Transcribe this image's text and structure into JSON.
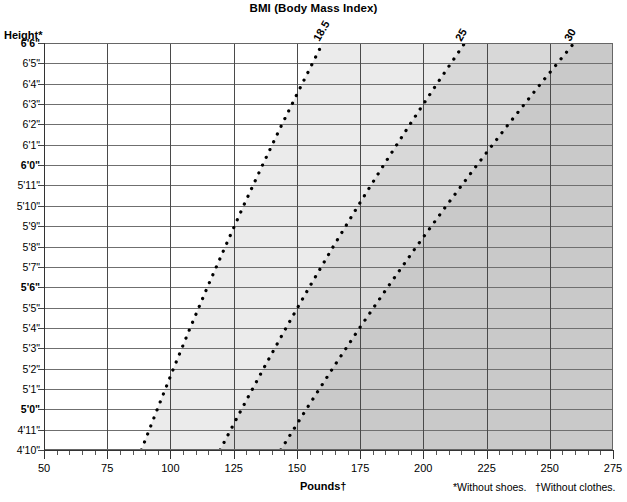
{
  "title": "BMI (Body Mass Index)",
  "axes": {
    "y_title": "Height*",
    "x_title": "Pounds†"
  },
  "footnotes": {
    "shoes": "*Without shoes.",
    "clothes": "†Without clothes."
  },
  "colors": {
    "band_underweight": "#ffffff",
    "band_normal": "#ebebeb",
    "band_overweight": "#d8d8d8",
    "band_obese": "#c9c9c9",
    "gridline": "#6f6f6f",
    "vgridline": "#4a4a4a",
    "curve": "#000000",
    "text": "#000000"
  },
  "chart_data": {
    "type": "line",
    "title": "BMI (Body Mass Index)",
    "xlabel": "Pounds†",
    "ylabel": "Height*",
    "xlim": [
      50,
      275
    ],
    "ylim_inches": [
      58,
      78
    ],
    "grid": true,
    "legend": "none",
    "x_ticks_major": [
      50,
      75,
      100,
      125,
      150,
      175,
      200,
      225,
      250,
      275
    ],
    "x_tick_minor_step": 5,
    "y_categories": [
      {
        "label": "6'6\"",
        "inches": 78,
        "bold": true
      },
      {
        "label": "6'5\"",
        "inches": 77,
        "bold": false
      },
      {
        "label": "6'4\"",
        "inches": 76,
        "bold": false
      },
      {
        "label": "6'3\"",
        "inches": 75,
        "bold": false
      },
      {
        "label": "6'2\"",
        "inches": 74,
        "bold": false
      },
      {
        "label": "6'1\"",
        "inches": 73,
        "bold": false
      },
      {
        "label": "6'0\"",
        "inches": 72,
        "bold": true
      },
      {
        "label": "5'11\"",
        "inches": 71,
        "bold": false
      },
      {
        "label": "5'10\"",
        "inches": 70,
        "bold": false
      },
      {
        "label": "5'9\"",
        "inches": 69,
        "bold": false
      },
      {
        "label": "5'8\"",
        "inches": 68,
        "bold": false
      },
      {
        "label": "5'7\"",
        "inches": 67,
        "bold": false
      },
      {
        "label": "5'6\"",
        "inches": 66,
        "bold": true
      },
      {
        "label": "5'5\"",
        "inches": 65,
        "bold": false
      },
      {
        "label": "5'4\"",
        "inches": 64,
        "bold": false
      },
      {
        "label": "5'3\"",
        "inches": 63,
        "bold": false
      },
      {
        "label": "5'2\"",
        "inches": 62,
        "bold": false
      },
      {
        "label": "5'1\"",
        "inches": 61,
        "bold": false
      },
      {
        "label": "5'0\"",
        "inches": 60,
        "bold": true
      },
      {
        "label": "4'11\"",
        "inches": 59,
        "bold": false
      },
      {
        "label": "4'10\"",
        "inches": 58,
        "bold": false
      }
    ],
    "series": [
      {
        "name": "18.5",
        "label": "18.5",
        "bmi": 18.5,
        "style": "dotted",
        "points_lbs_at_height": [
          {
            "inches": 58,
            "lbs": 88.5
          },
          {
            "inches": 60,
            "lbs": 94.8
          },
          {
            "inches": 62,
            "lbs": 101.2
          },
          {
            "inches": 64,
            "lbs": 107.8
          },
          {
            "inches": 66,
            "lbs": 114.6
          },
          {
            "inches": 68,
            "lbs": 121.7
          },
          {
            "inches": 70,
            "lbs": 128.9
          },
          {
            "inches": 72,
            "lbs": 136.4
          },
          {
            "inches": 74,
            "lbs": 144.1
          },
          {
            "inches": 76,
            "lbs": 152.1
          },
          {
            "inches": 78,
            "lbs": 160.2
          }
        ]
      },
      {
        "name": "25",
        "label": "25",
        "bmi": 25,
        "style": "dotted",
        "points_lbs_at_height": [
          {
            "inches": 58,
            "lbs": 119.6
          },
          {
            "inches": 60,
            "lbs": 128.1
          },
          {
            "inches": 62,
            "lbs": 136.8
          },
          {
            "inches": 64,
            "lbs": 145.7
          },
          {
            "inches": 66,
            "lbs": 154.9
          },
          {
            "inches": 68,
            "lbs": 164.4
          },
          {
            "inches": 70,
            "lbs": 174.2
          },
          {
            "inches": 72,
            "lbs": 184.3
          },
          {
            "inches": 74,
            "lbs": 194.7
          },
          {
            "inches": 76,
            "lbs": 205.4
          },
          {
            "inches": 78,
            "lbs": 216.4
          }
        ]
      },
      {
        "name": "30",
        "label": "30",
        "bmi": 30,
        "style": "dotted",
        "points_lbs_at_height": [
          {
            "inches": 58,
            "lbs": 143.6
          },
          {
            "inches": 60,
            "lbs": 153.7
          },
          {
            "inches": 62,
            "lbs": 164.1
          },
          {
            "inches": 64,
            "lbs": 174.8
          },
          {
            "inches": 66,
            "lbs": 185.9
          },
          {
            "inches": 68,
            "lbs": 197.3
          },
          {
            "inches": 70,
            "lbs": 209.1
          },
          {
            "inches": 72,
            "lbs": 221.2
          },
          {
            "inches": 74,
            "lbs": 233.6
          },
          {
            "inches": 76,
            "lbs": 246.4
          },
          {
            "inches": 78,
            "lbs": 259.6
          }
        ]
      }
    ],
    "bands": [
      {
        "name": "underweight",
        "from_bmi": 0,
        "to_bmi": 18.5,
        "color": "#ffffff"
      },
      {
        "name": "normal",
        "from_bmi": 18.5,
        "to_bmi": 25,
        "color": "#ebebeb"
      },
      {
        "name": "overweight",
        "from_bmi": 25,
        "to_bmi": 30,
        "color": "#d8d8d8"
      },
      {
        "name": "obese",
        "from_bmi": 30,
        "to_bmi": 99,
        "color": "#c9c9c9"
      }
    ]
  }
}
